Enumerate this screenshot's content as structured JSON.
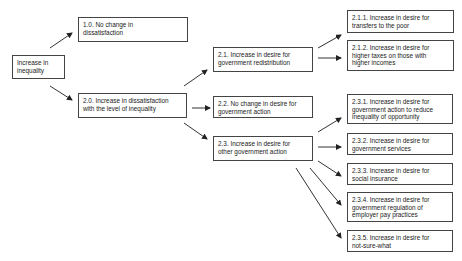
{
  "diagram": {
    "root": {
      "label": "Increase in\ninequality"
    },
    "level1": [
      {
        "id": "1.0",
        "label": "1.0. No change in\ndissatisfaction"
      },
      {
        "id": "2.0",
        "label": "2.0. Increase in dissatisfaction\nwith the level of inequality"
      }
    ],
    "level2": [
      {
        "id": "2.1",
        "label": "2.1. Increase in desire for\ngovernment redistribution"
      },
      {
        "id": "2.2",
        "label": "2.2. No change in desire for\ngovernment action"
      },
      {
        "id": "2.3",
        "label": "2.3. Increase in desire for\nother government action"
      }
    ],
    "level3": [
      {
        "id": "2.1.1",
        "label": "2.1.1. Increase in desire for\ntransfers to the poor"
      },
      {
        "id": "2.1.2",
        "label": "2.1.2. Increase in desire for\nhigher taxes on those with\nhigher incomes"
      },
      {
        "id": "2.3.1",
        "label": "2.3.1. Increase in desire for\ngovernment action to reduce\ninequality of opportunity"
      },
      {
        "id": "2.3.2",
        "label": "2.3.2. Increase in desire for\ngovernment services"
      },
      {
        "id": "2.3.3",
        "label": "2.3.3. Increase in desire for\nsocial insurance"
      },
      {
        "id": "2.3.4",
        "label": "2.3.4. Increase in desire for\ngovernment regulation of\nemployer pay practices"
      },
      {
        "id": "2.3.5",
        "label": "2.3.5. Increase in desire for\nnot-sure-what"
      }
    ],
    "colors": {
      "line": "#333333",
      "border": "#444444",
      "text": "#222222",
      "background": "#ffffff"
    }
  }
}
